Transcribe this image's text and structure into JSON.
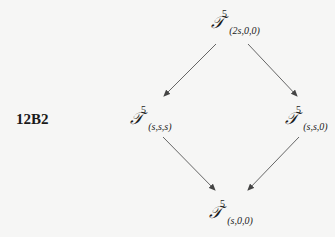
{
  "diagram": {
    "id_label": "12B2",
    "nodes": {
      "top": {
        "symbol": "𝒯",
        "sup": "5",
        "sub": "(2s,0,0)"
      },
      "left": {
        "symbol": "𝒯",
        "sup": "5",
        "sub": "(s,s,s)"
      },
      "right": {
        "symbol": "𝒯",
        "sup": "5",
        "sub": "(s,s,0)"
      },
      "bottom": {
        "symbol": "𝒯",
        "sup": "5",
        "sub": "(s,0,0)"
      }
    },
    "edges": [
      {
        "from": "top",
        "to": "left"
      },
      {
        "from": "top",
        "to": "right"
      },
      {
        "from": "left",
        "to": "bottom"
      },
      {
        "from": "right",
        "to": "bottom"
      }
    ],
    "colors": {
      "background": "#f6f6f5",
      "arrow": "#555555",
      "text": "#1a1a1a"
    }
  }
}
